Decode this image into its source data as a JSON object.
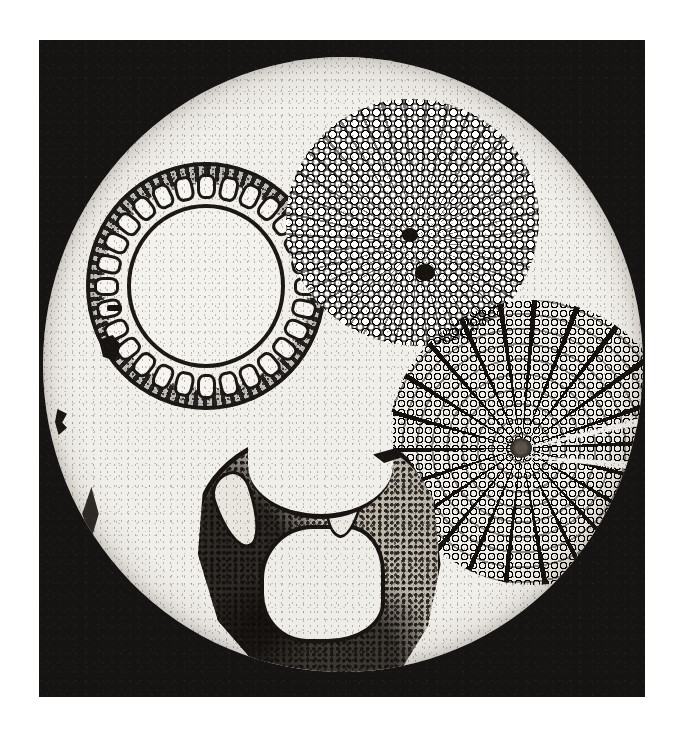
{
  "plate": {
    "kind": "halftone-micrograph",
    "medium": "printed black-and-white photomicrograph on white page",
    "page_background": "#ffffff",
    "frame_color": "#151413",
    "field_color": "#f1efea",
    "ink_color": "#171310"
  },
  "frame": {
    "label": "photographic print border",
    "x": 39,
    "y": 40,
    "width": 606,
    "height": 657
  },
  "field": {
    "label": "circular microscope field of view",
    "center_x": 343,
    "center_y": 364,
    "radius_x": 300,
    "radius_y": 307
  },
  "specimens": [
    {
      "id": "stem-hollow",
      "label": "hollow stem cross-section with ring of vascular bundles",
      "position": "upper left",
      "bundle_count": 28,
      "has_central_lumen": true
    },
    {
      "id": "root-dense",
      "label": "dense parenchyma root cross-section",
      "position": "upper right",
      "texture": "rounded cells, radial arrangement",
      "dark_vascular_cores": 2
    },
    {
      "id": "stem-radial",
      "label": "woody stem cross-section with radiating medullary rays",
      "position": "right",
      "ray_count": 22,
      "has_central_pith": true,
      "radial_cracks": 2
    },
    {
      "id": "petiole",
      "label": "petiole / leaf base cross-section with dark cortical tissue",
      "position": "lower centre",
      "vascular_strands": 2,
      "has_adaxial_notch": true
    }
  ],
  "artifacts": [
    {
      "id": "debris-1",
      "label": "fibre artifact near left field margin"
    },
    {
      "id": "debris-2",
      "label": "dust speck near left field margin"
    },
    {
      "id": "debris-3",
      "label": "torn tissue fragment at lower left margin"
    },
    {
      "id": "debris-4",
      "label": "dark mounting-medium blot"
    },
    {
      "id": "debris-5",
      "label": "small dark flake"
    },
    {
      "id": "debris-6",
      "label": "dark fragment beside petiole section"
    }
  ]
}
